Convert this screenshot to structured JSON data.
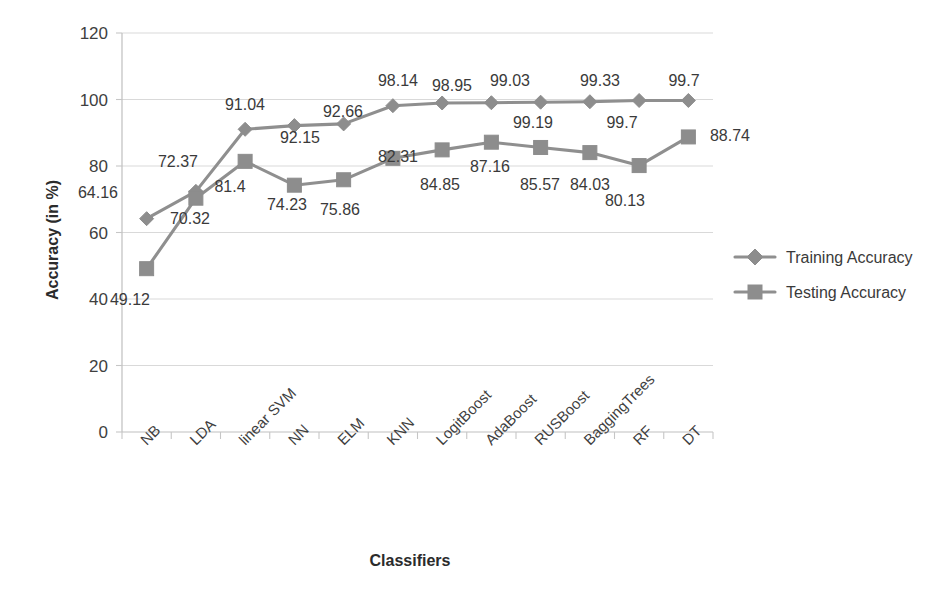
{
  "chart_data": {
    "type": "line",
    "title": "",
    "xlabel": "Classifiers",
    "ylabel": "Accuracy (in %)",
    "ylim": [
      0,
      120
    ],
    "ytick_step": 20,
    "yticks": [
      0,
      20,
      40,
      60,
      80,
      100,
      120
    ],
    "grid": true,
    "legend_position": "right",
    "categories": [
      "NB",
      "LDA",
      "linear SVM",
      "NN",
      "ELM",
      "KNN",
      "LogitBoost",
      "AdaBoost",
      "RUSBoost",
      "BaggingTrees",
      "RF",
      "DT"
    ],
    "series": [
      {
        "name": "Training Accuracy",
        "marker": "diamond",
        "color": "#8d8d8d",
        "values": [
          64.16,
          72.37,
          91.04,
          92.15,
          92.66,
          98.14,
          98.95,
          99.03,
          99.19,
          99.33,
          99.7,
          99.7
        ],
        "labels": [
          "64.16",
          "72.37",
          "91.04",
          "92.15",
          "92.66",
          "98.14",
          "98.95",
          "99.03",
          "99.19",
          "99.33",
          "99.7",
          "99.7"
        ]
      },
      {
        "name": "Testing Accuracy",
        "marker": "square",
        "color": "#8d8d8d",
        "values": [
          49.12,
          70.32,
          81.4,
          74.23,
          75.86,
          82.31,
          84.85,
          87.16,
          85.57,
          84.03,
          80.13,
          88.74
        ],
        "labels": [
          "49.12",
          "70.32",
          "81.4",
          "74.23",
          "75.86",
          "82.31",
          "84.85",
          "87.16",
          "85.57",
          "84.03",
          "80.13",
          "88.74"
        ]
      }
    ]
  },
  "axis": {
    "y_tick_labels": [
      "120",
      "100",
      "80",
      "60",
      "40",
      "20",
      "0"
    ],
    "y_title": "Accuracy (in %)",
    "x_title": "Classifiers"
  },
  "legend": {
    "items": [
      {
        "label": "Training Accuracy",
        "marker": "diamond-marker-icon"
      },
      {
        "label": "Testing Accuracy",
        "marker": "square-marker-icon"
      }
    ]
  },
  "data_labels": {
    "training": [
      {
        "text": "64.16",
        "x": 98,
        "y": 198
      },
      {
        "text": "72.37",
        "x": 178,
        "y": 167
      },
      {
        "text": "91.04",
        "x": 245,
        "y": 110
      },
      {
        "text": "92.15",
        "x": 300,
        "y": 143
      },
      {
        "text": "92.66",
        "x": 343,
        "y": 117
      },
      {
        "text": "98.14",
        "x": 398,
        "y": 86
      },
      {
        "text": "98.95",
        "x": 452,
        "y": 91
      },
      {
        "text": "99.03",
        "x": 510,
        "y": 86
      },
      {
        "text": "99.19",
        "x": 533,
        "y": 128
      },
      {
        "text": "99.33",
        "x": 600,
        "y": 86
      },
      {
        "text": "99.7",
        "x": 622,
        "y": 128
      },
      {
        "text": "99.7",
        "x": 684,
        "y": 86
      }
    ],
    "testing": [
      {
        "text": "49.12",
        "x": 130,
        "y": 305
      },
      {
        "text": "70.32",
        "x": 190,
        "y": 224
      },
      {
        "text": "81.4",
        "x": 230,
        "y": 192
      },
      {
        "text": "74.23",
        "x": 287,
        "y": 210
      },
      {
        "text": "75.86",
        "x": 340,
        "y": 215
      },
      {
        "text": "82.31",
        "x": 398,
        "y": 162
      },
      {
        "text": "84.85",
        "x": 440,
        "y": 190
      },
      {
        "text": "87.16",
        "x": 490,
        "y": 172
      },
      {
        "text": "85.57",
        "x": 540,
        "y": 190
      },
      {
        "text": "84.03",
        "x": 590,
        "y": 190
      },
      {
        "text": "80.13",
        "x": 625,
        "y": 206
      },
      {
        "text": "88.74",
        "x": 730,
        "y": 141
      }
    ]
  }
}
